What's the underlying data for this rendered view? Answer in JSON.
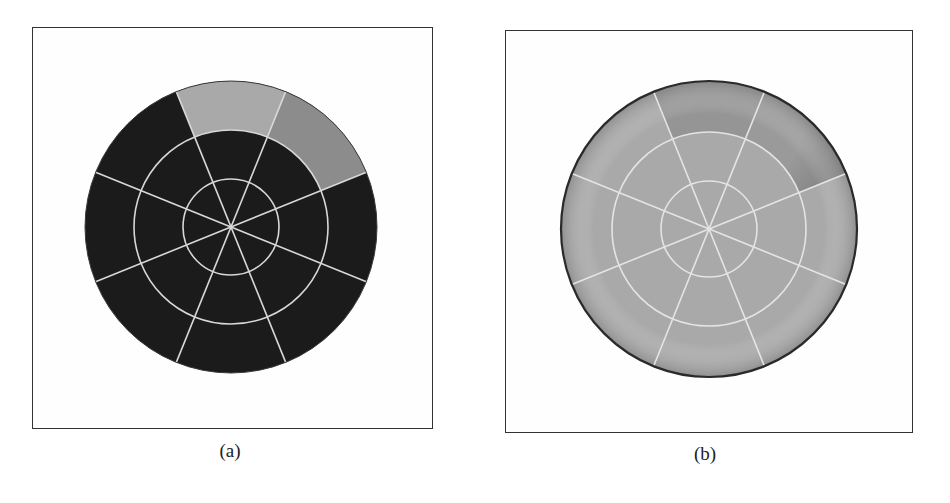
{
  "figure": {
    "panels": [
      {
        "id": "a",
        "caption": "(a)",
        "description": "Bullseye (polar) plot with 3 rings and 8 sectors; dark fill with two highlighted outer-ring sectors at top",
        "colors": {
          "base": "#1b1b1b",
          "highlight_top": "#a9a9a9",
          "highlight_upper_right": "#8c8c8c",
          "grid": "#d8d8d8"
        }
      },
      {
        "id": "b",
        "caption": "(b)",
        "description": "Bullseye (polar) plot with 3 rings and 8 sectors; light gray fill with darker shading toward the top and upper-right outer edge",
        "colors": {
          "base": "#a9a9a9",
          "shade_dark": "#6e6e6e",
          "edge": "#2a2a2a",
          "grid": "#e4e4e4"
        }
      }
    ],
    "grid": {
      "rings": 3,
      "sectors": 8,
      "spoke_angles_deg": [
        22,
        68,
        112,
        158,
        202,
        248,
        292,
        338
      ]
    }
  }
}
